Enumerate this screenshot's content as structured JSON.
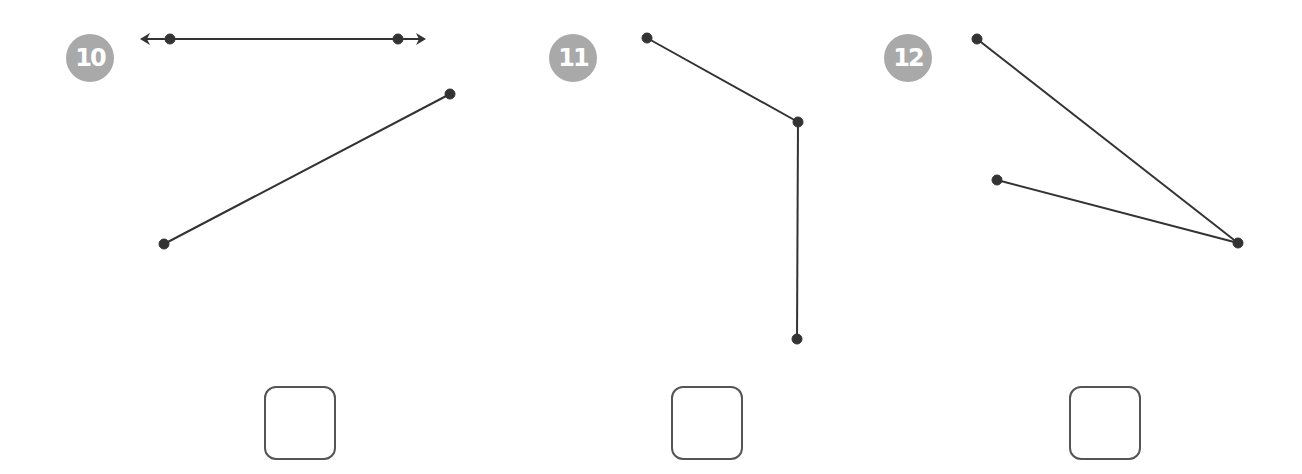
{
  "problems": [
    {
      "number": "10",
      "figure_type": "line-and-segment",
      "badge": {
        "x": 66,
        "y": 34
      },
      "line": {
        "from": [
          170,
          39
        ],
        "to": [
          398,
          39
        ],
        "arrows": true,
        "arrow_left_x": 142,
        "arrow_right_x": 424
      },
      "segment": {
        "from": [
          164,
          244
        ],
        "to": [
          450,
          94
        ]
      },
      "answer_box": {
        "x": 264,
        "y": 386
      }
    },
    {
      "number": "11",
      "figure_type": "angle",
      "badge": {
        "x": 549,
        "y": 34
      },
      "vertex": [
        798,
        122
      ],
      "rays": [
        [
          647,
          38
        ],
        [
          797,
          339
        ]
      ],
      "answer_box": {
        "x": 671,
        "y": 386
      }
    },
    {
      "number": "12",
      "figure_type": "angle",
      "badge": {
        "x": 884,
        "y": 34
      },
      "vertex": [
        1238,
        243
      ],
      "rays": [
        [
          977,
          39
        ],
        [
          997,
          180
        ]
      ],
      "answer_box": {
        "x": 1069,
        "y": 386
      }
    }
  ],
  "colors": {
    "badge": "#a9a9a9",
    "stroke": "#333333",
    "box_border": "#555555"
  }
}
